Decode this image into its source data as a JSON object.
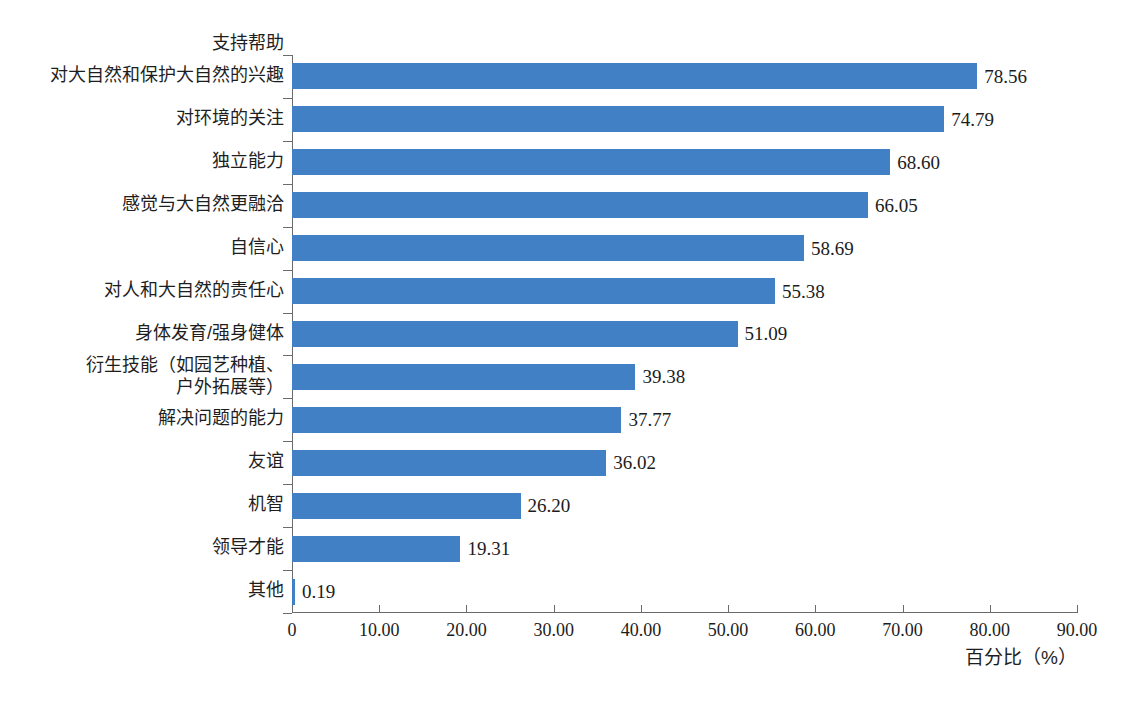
{
  "chart_data": {
    "type": "bar",
    "orientation": "horizontal",
    "title": "",
    "xlabel": "百分比（%）",
    "ylabel": "",
    "top_category_label": "支持帮助",
    "categories": [
      "对大自然和保护大自然的兴趣",
      "对环境的关注",
      "独立能力",
      "感觉与大自然更融洽",
      "自信心",
      "对人和大自然的责任心",
      "身体发育/强身健体",
      "衍生技能（如园艺种植、\n户外拓展等）",
      "解决问题的能力",
      "友谊",
      "机智",
      "领导才能",
      "其他"
    ],
    "values": [
      78.56,
      74.79,
      68.6,
      66.05,
      58.69,
      55.38,
      51.09,
      39.38,
      37.77,
      36.02,
      26.2,
      19.31,
      0.19
    ],
    "value_labels": [
      "78.56",
      "74.79",
      "68.60",
      "66.05",
      "58.69",
      "55.38",
      "51.09",
      "39.38",
      "37.77",
      "36.02",
      "26.20",
      "19.31",
      "0.19"
    ],
    "xlim": [
      0,
      90
    ],
    "xticks": [
      0,
      10,
      20,
      30,
      40,
      50,
      60,
      70,
      80,
      90
    ],
    "xtick_labels": [
      "0",
      "10.00",
      "20.00",
      "30.00",
      "40.00",
      "50.00",
      "60.00",
      "70.00",
      "80.00",
      "90.00"
    ],
    "grid": false,
    "legend": "none",
    "bar_color": "#4180c4",
    "axis_color": "#6b6b6b",
    "text_color": "#1c1c1c"
  },
  "caption": ""
}
